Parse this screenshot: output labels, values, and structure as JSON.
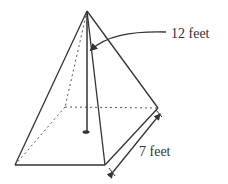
{
  "diagram": {
    "type": "square pyramid",
    "labels": {
      "height": "12 feet",
      "base_side": "7 feet"
    },
    "colors": {
      "line": "#333333",
      "background": "#ffffff"
    }
  }
}
